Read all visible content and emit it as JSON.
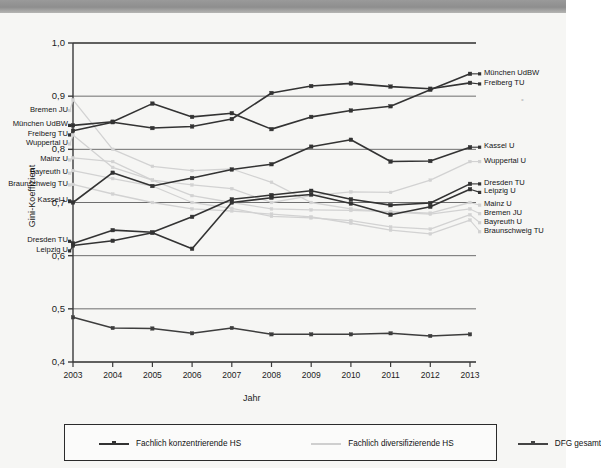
{
  "header": {
    "bar_name": "window-title-bar"
  },
  "chart_data": {
    "type": "line",
    "title": "",
    "xlabel": "Jahr",
    "ylabel": "Gini-Koeffizient",
    "x": [
      2003,
      2004,
      2005,
      2006,
      2007,
      2008,
      2009,
      2010,
      2011,
      2012,
      2013
    ],
    "xticklabels": [
      "2003",
      "2004",
      "2005",
      "2006",
      "2007",
      "2008",
      "2009",
      "2010",
      "2011",
      "2012",
      "2013"
    ],
    "ylim": [
      0.4,
      1.0
    ],
    "yticks": [
      0.4,
      0.5,
      0.6,
      0.7,
      0.8,
      0.9,
      1.0
    ],
    "yticklabels": [
      "0,4",
      "0,5",
      "0,6",
      "0,7",
      "0,8",
      "0,9",
      "1,0"
    ],
    "grid": "horizontal",
    "legend_position": "below-axes",
    "legend": [
      {
        "label": "Fachlich konzentrierende HS",
        "color": "#333333",
        "marker": "square"
      },
      {
        "label": "Fachlich diversifizierende HS",
        "color": "#cfcfcf",
        "marker": "none"
      },
      {
        "label": "DFG gesamt",
        "color": "#444444",
        "marker": "square"
      }
    ],
    "series": [
      {
        "name": "München UdBW",
        "group": "Fachlich konzentrierende HS",
        "color": "#333333",
        "label_left": "München UdBW",
        "label_right": "München UdBW",
        "values": [
          0.845,
          0.852,
          0.886,
          0.861,
          0.868,
          0.838,
          0.861,
          0.873,
          0.881,
          0.912,
          0.942
        ]
      },
      {
        "name": "Freiberg TU",
        "group": "Fachlich konzentrierende HS",
        "color": "#333333",
        "label_left": "Freiberg TU",
        "label_right": "Freiberg TU",
        "values": [
          0.835,
          0.851,
          0.84,
          0.843,
          0.857,
          0.906,
          0.919,
          0.924,
          0.918,
          0.914,
          0.925
        ]
      },
      {
        "name": "Kassel U",
        "group": "Fachlich konzentrierende HS",
        "color": "#333333",
        "label_left": "Kassel U",
        "label_right": "Kassel U",
        "values": [
          0.7,
          0.756,
          0.731,
          0.746,
          0.762,
          0.772,
          0.805,
          0.818,
          0.777,
          0.778,
          0.804
        ]
      },
      {
        "name": "Dresden TU",
        "group": "Fachlich konzentrierende HS",
        "color": "#333333",
        "label_left": "Dresden TU",
        "label_right": "Dresden TU",
        "values": [
          0.623,
          0.648,
          0.644,
          0.673,
          0.706,
          0.714,
          0.722,
          0.706,
          0.695,
          0.699,
          0.735
        ]
      },
      {
        "name": "Leipzig U",
        "group": "Fachlich konzentrierende HS",
        "color": "#333333",
        "label_left": "Leipzig U",
        "label_right": "Leipzig U",
        "values": [
          0.619,
          0.628,
          0.643,
          0.613,
          0.7,
          0.709,
          0.715,
          0.698,
          0.677,
          0.692,
          0.725
        ]
      },
      {
        "name": "Bremen JU",
        "group": "Fachlich diversifizierende HS",
        "color": "#d2d2d2",
        "label_left": "Bremen JU",
        "label_right": "Bremen JU",
        "values": [
          0.893,
          0.8,
          0.768,
          0.76,
          0.763,
          0.738,
          0.7,
          0.688,
          0.682,
          0.678,
          0.688
        ]
      },
      {
        "name": "Wuppertal U",
        "group": "Fachlich diversifizierende HS",
        "color": "#d2d2d2",
        "label_left": "Wuppertal U",
        "label_right": "Wuppertal U",
        "values": [
          0.827,
          0.766,
          0.742,
          0.733,
          0.726,
          0.7,
          0.713,
          0.72,
          0.719,
          0.742,
          0.777
        ]
      },
      {
        "name": "Mainz U",
        "group": "Fachlich diversifizierende HS",
        "color": "#d2d2d2",
        "label_left": "Mainz U",
        "label_right": "Mainz U",
        "values": [
          0.784,
          0.777,
          0.742,
          0.713,
          0.7,
          0.688,
          0.686,
          0.685,
          0.683,
          0.68,
          0.7
        ]
      },
      {
        "name": "Bayreuth U",
        "group": "Fachlich diversifizierende HS",
        "color": "#d2d2d2",
        "label_left": "Bayreuth U",
        "label_right": "Bayreuth U",
        "values": [
          0.76,
          0.745,
          0.731,
          0.7,
          0.689,
          0.674,
          0.671,
          0.666,
          0.654,
          0.65,
          0.677
        ]
      },
      {
        "name": "Braunschweig TU",
        "group": "Fachlich diversifizierende HS",
        "color": "#d2d2d2",
        "label_left": "Braunschweig TU",
        "label_right": "Braunschweig TU",
        "values": [
          0.734,
          0.716,
          0.7,
          0.688,
          0.684,
          0.678,
          0.673,
          0.661,
          0.648,
          0.641,
          0.667
        ]
      },
      {
        "name": "DFG gesamt",
        "group": "DFG gesamt",
        "color": "#3d3d3d",
        "label_left": "",
        "label_right": "",
        "values": [
          0.484,
          0.464,
          0.463,
          0.454,
          0.464,
          0.452,
          0.452,
          0.452,
          0.454,
          0.449,
          0.452
        ]
      }
    ],
    "left_label_groups": [
      {
        "labels": [
          "Bremen JU"
        ],
        "value": 0.873
      },
      {
        "labels": [
          "München UdBW"
        ],
        "value": 0.845
      },
      {
        "labels": [
          "Freiberg TU"
        ],
        "value": 0.827
      },
      {
        "labels": [
          "Wuppertal U"
        ],
        "value": 0.81
      },
      {
        "labels": [
          "Mainz U"
        ],
        "value": 0.78
      },
      {
        "labels": [
          "Bayreuth U"
        ],
        "value": 0.755
      },
      {
        "labels": [
          "Braunschweig TU"
        ],
        "value": 0.733
      },
      {
        "labels": [
          "Kassel U"
        ],
        "value": 0.703
      },
      {
        "labels": [
          "Dresden TU"
        ],
        "value": 0.627
      },
      {
        "labels": [
          "Leipzig U"
        ],
        "value": 0.609
      }
    ],
    "right_label_groups": [
      {
        "labels": [
          "München UdBW"
        ],
        "value": 0.942
      },
      {
        "labels": [
          "Freiberg TU"
        ],
        "value": 0.923
      },
      {
        "labels": [
          "Kassel U"
        ],
        "value": 0.804
      },
      {
        "labels": [
          "Wuppertal U"
        ],
        "value": 0.777
      },
      {
        "labels": [
          "Dresden TU"
        ],
        "value": 0.735
      },
      {
        "labels": [
          "Leipzig U"
        ],
        "value": 0.719
      },
      {
        "labels": [
          "Mainz U"
        ],
        "value": 0.695
      },
      {
        "labels": [
          "Bremen JU"
        ],
        "value": 0.679
      },
      {
        "labels": [
          "Bayreuth U"
        ],
        "value": 0.662
      },
      {
        "labels": [
          "Braunschweig TU"
        ],
        "value": 0.645
      }
    ]
  }
}
